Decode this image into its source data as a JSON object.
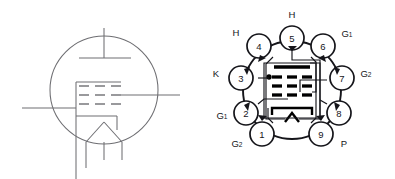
{
  "figure": {
    "background_color": "#ffffff",
    "line_color_symbol": "#6e6e72",
    "line_color_socket": "#15151a",
    "electrode_color": "#000000"
  },
  "tube_symbol": {
    "name": "tube-schematic-symbol",
    "envelope": "circle",
    "electrodes": [
      {
        "id": "plate",
        "label": "",
        "shape": "horizontal-bar-with-top-lead"
      },
      {
        "id": "grid-row-1",
        "label": "",
        "shape": "dashed-line"
      },
      {
        "id": "grid-row-2",
        "label": "",
        "shape": "dashed-line"
      },
      {
        "id": "grid-row-3",
        "label": "",
        "shape": "dashed-line"
      },
      {
        "id": "cathode",
        "label": "",
        "shape": "bracket"
      },
      {
        "id": "heater",
        "label": "",
        "shape": "inverted-v"
      }
    ],
    "leads": [
      {
        "id": "plate-lead",
        "direction": "up"
      },
      {
        "id": "grid-lead-left",
        "direction": "left"
      },
      {
        "id": "grid-lead-right",
        "direction": "right"
      },
      {
        "id": "heater-lead-left",
        "direction": "down"
      },
      {
        "id": "heater-lead-right",
        "direction": "down"
      },
      {
        "id": "cathode-lead",
        "direction": "down"
      }
    ]
  },
  "socket_diagram": {
    "name": "nine-pin-base-pinout",
    "pin_count": 9,
    "pins": [
      {
        "number": "1",
        "label": "G",
        "sub": "2",
        "label_full": "G2",
        "label_pos": "bottom-left"
      },
      {
        "number": "2",
        "label": "G",
        "sub": "1",
        "label_full": "G1",
        "label_pos": "left"
      },
      {
        "number": "3",
        "label": "K",
        "sub": "",
        "label_full": "K",
        "label_pos": "left"
      },
      {
        "number": "4",
        "label": "H",
        "sub": "",
        "label_full": "H",
        "label_pos": "upper-left"
      },
      {
        "number": "5",
        "label": "H",
        "sub": "",
        "label_full": "H",
        "label_pos": "top"
      },
      {
        "number": "6",
        "label": "G",
        "sub": "1",
        "label_full": "G1",
        "label_pos": "upper-right"
      },
      {
        "number": "7",
        "label": "G",
        "sub": "2",
        "label_full": "G2",
        "label_pos": "right"
      },
      {
        "number": "8",
        "label": "",
        "sub": "",
        "label_full": "",
        "label_pos": "right"
      },
      {
        "number": "9",
        "label": "P",
        "sub": "",
        "label_full": "P",
        "label_pos": "bottom-right"
      }
    ],
    "internal_electrodes": [
      {
        "id": "plate",
        "shape": "solid-bar"
      },
      {
        "id": "grid-row-1",
        "shape": "three-dashes"
      },
      {
        "id": "grid-row-2",
        "shape": "three-dashes"
      },
      {
        "id": "grid-row-3",
        "shape": "three-dashes"
      },
      {
        "id": "cathode",
        "shape": "bracket"
      },
      {
        "id": "heater",
        "shape": "inverted-v"
      }
    ],
    "junction_dots": 1
  }
}
